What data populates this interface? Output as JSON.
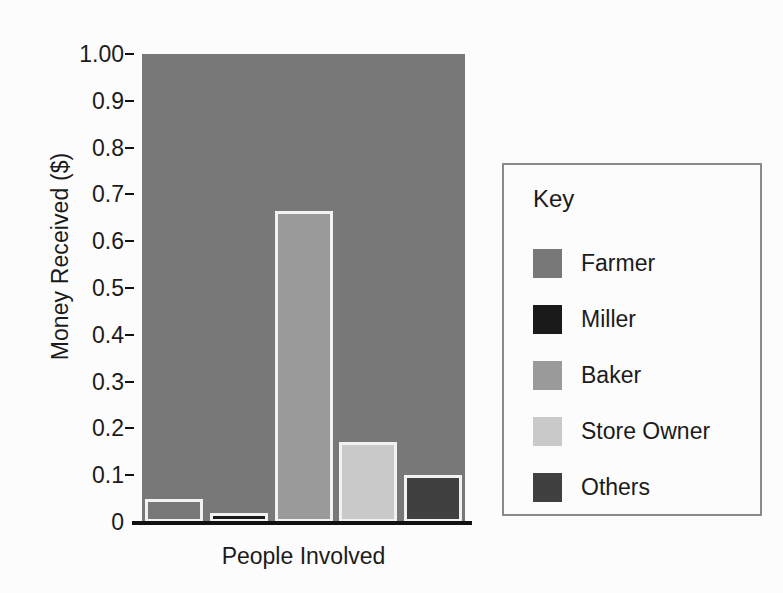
{
  "chart_data": {
    "type": "bar",
    "title": "",
    "xlabel": "People Involved",
    "ylabel": "Money Received ($)",
    "categories": [
      "Farmer",
      "Miller",
      "Baker",
      "Store Owner",
      "Others"
    ],
    "values": [
      0.05,
      0.02,
      0.665,
      0.17,
      0.1
    ],
    "colors": [
      "#787878",
      "#1a1a1a",
      "#9a9a9a",
      "#c9c9c9",
      "#404040"
    ],
    "ylim": [
      0,
      1.0
    ],
    "ytick_labels": [
      "1.00",
      "0.9",
      "0.8",
      "0.7",
      "0.6",
      "0.5",
      "0.4",
      "0.3",
      "0.2",
      "0.1",
      "0"
    ],
    "ytick_values": [
      1.0,
      0.9,
      0.8,
      0.7,
      0.6,
      0.5,
      0.4,
      0.3,
      0.2,
      0.1,
      0
    ],
    "grid": false,
    "legend_position": "right",
    "legend_title": "Key",
    "plot_background": "#787878",
    "bar_outline_color": "#f2f2f2",
    "axis_color": "#111111",
    "page_background": "#fcfcfc"
  },
  "legend": {
    "title": "Key",
    "items": [
      {
        "label": "Farmer",
        "color": "#787878"
      },
      {
        "label": "Miller",
        "color": "#1a1a1a"
      },
      {
        "label": "Baker",
        "color": "#9a9a9a"
      },
      {
        "label": "Store Owner",
        "color": "#c9c9c9"
      },
      {
        "label": "Others",
        "color": "#404040"
      }
    ]
  },
  "axes": {
    "y_title": "Money Received ($)",
    "x_title": "People Involved"
  }
}
